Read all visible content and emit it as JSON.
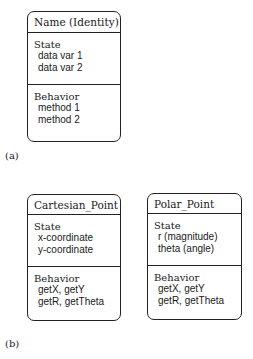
{
  "figure_a": {
    "label": "(a)",
    "box": {
      "name": "Name (Identity)",
      "state_title": "State",
      "state_items": [
        "data var 1",
        "data var 2"
      ],
      "behavior_title": "Behavior",
      "behavior_items": [
        "method 1",
        "method 2"
      ]
    }
  },
  "figure_b": {
    "label": "(b)",
    "boxes": [
      {
        "name": "Cartesian_Point",
        "state_title": "State",
        "state_items": [
          "x-coordinate",
          "y-coordinate"
        ],
        "behavior_title": "Behavior",
        "behavior_items": [
          "getX, getY",
          "getR, getTheta"
        ]
      },
      {
        "name": "Polar_Point",
        "state_title": "State",
        "state_items": [
          "r (magnitude)",
          "theta (angle)"
        ],
        "behavior_title": "Behavior",
        "behavior_items": [
          "getX, getY",
          "getR, getTheta"
        ]
      }
    ]
  }
}
